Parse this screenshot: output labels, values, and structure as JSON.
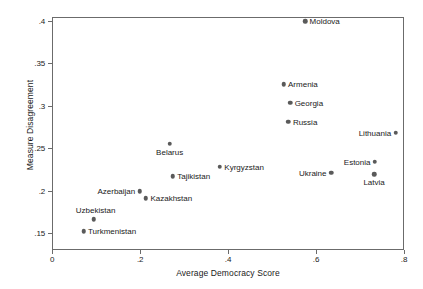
{
  "chart_data": {
    "type": "scatter",
    "title": "",
    "xlabel": "Average Democracy Score",
    "ylabel": "Measure Disagreement",
    "xlim": [
      0,
      0.8
    ],
    "ylim": [
      0.15,
      0.4
    ],
    "xticks": [
      "0",
      ".2",
      ".4",
      ".6",
      ".8"
    ],
    "xtick_values": [
      0,
      0.2,
      0.4,
      0.6,
      0.8
    ],
    "yticks": [
      ".15",
      ".2",
      ".25",
      ".3",
      ".35",
      ".4"
    ],
    "ytick_values": [
      0.15,
      0.2,
      0.25,
      0.3,
      0.35,
      0.4
    ],
    "grid": false,
    "legend": "none",
    "marker_color": "#5a5a5a",
    "points": [
      {
        "label": "Moldova",
        "x": 0.575,
        "y": 0.4,
        "label_pos": "right"
      },
      {
        "label": "Armenia",
        "x": 0.526,
        "y": 0.326,
        "label_pos": "right"
      },
      {
        "label": "Georgia",
        "x": 0.541,
        "y": 0.304,
        "label_pos": "right"
      },
      {
        "label": "Russia",
        "x": 0.537,
        "y": 0.282,
        "label_pos": "right"
      },
      {
        "label": "Lithuania",
        "x": 0.781,
        "y": 0.269,
        "label_pos": "left"
      },
      {
        "label": "Belarus",
        "x": 0.267,
        "y": 0.256,
        "label_pos": "below"
      },
      {
        "label": "Kyrgyzstan",
        "x": 0.381,
        "y": 0.229,
        "label_pos": "right"
      },
      {
        "label": "Estonia",
        "x": 0.734,
        "y": 0.235,
        "label_pos": "left"
      },
      {
        "label": "Ukraine",
        "x": 0.634,
        "y": 0.222,
        "label_pos": "left"
      },
      {
        "label": "Latvia",
        "x": 0.732,
        "y": 0.22,
        "label_pos": "below"
      },
      {
        "label": "Tajikistan",
        "x": 0.274,
        "y": 0.218,
        "label_pos": "right"
      },
      {
        "label": "Azerbaijan",
        "x": 0.199,
        "y": 0.2,
        "label_pos": "left"
      },
      {
        "label": "Kazakhstan",
        "x": 0.213,
        "y": 0.192,
        "label_pos": "right"
      },
      {
        "label": "Uzbekistan",
        "x": 0.094,
        "y": 0.167,
        "label_pos": "below-left"
      },
      {
        "label": "Turkmenistan",
        "x": 0.071,
        "y": 0.153,
        "label_pos": "right"
      }
    ]
  }
}
